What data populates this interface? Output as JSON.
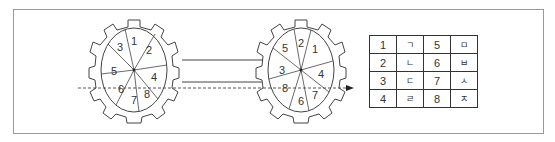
{
  "left_gear": {
    "sectors": [
      "1",
      "2",
      "4",
      "8",
      "7",
      "6",
      "5",
      "3"
    ]
  },
  "right_gear": {
    "sectors": [
      "2",
      "1",
      "4",
      "7",
      "6",
      "8",
      "3",
      "5"
    ]
  },
  "table": {
    "rows": [
      [
        "1",
        "ㄱ",
        "5",
        "ㅁ"
      ],
      [
        "2",
        "ㄴ",
        "6",
        "ㅂ"
      ],
      [
        "3",
        "ㄷ",
        "7",
        "ㅅ"
      ],
      [
        "4",
        "ㄹ",
        "8",
        "ㅈ"
      ]
    ]
  }
}
